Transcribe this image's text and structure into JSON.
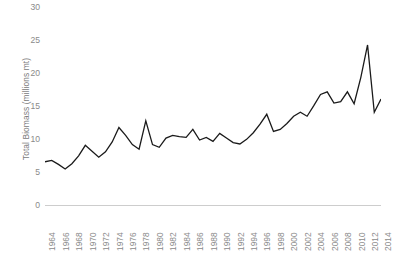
{
  "chart_data": {
    "type": "line",
    "title": "",
    "xlabel": "",
    "ylabel": "Total Biomass (millions mt)",
    "ylim": [
      0,
      30
    ],
    "xlim": [
      1964,
      2014
    ],
    "grid": false,
    "legend": false,
    "y_ticks": [
      0,
      5,
      10,
      15,
      20,
      25,
      30
    ],
    "x_ticks": [
      1964,
      1966,
      1968,
      1970,
      1972,
      1974,
      1976,
      1978,
      1980,
      1982,
      1984,
      1986,
      1988,
      1990,
      1992,
      1994,
      1996,
      1998,
      2000,
      2002,
      2004,
      2006,
      2008,
      2010,
      2012,
      2014
    ],
    "series": [
      {
        "name": "Total Biomass",
        "color": "#1a1a1a",
        "x": [
          1964,
          1965,
          1966,
          1967,
          1968,
          1969,
          1970,
          1971,
          1972,
          1973,
          1974,
          1975,
          1976,
          1977,
          1978,
          1979,
          1980,
          1981,
          1982,
          1983,
          1984,
          1985,
          1986,
          1987,
          1988,
          1989,
          1990,
          1991,
          1992,
          1993,
          1994,
          1995,
          1996,
          1997,
          1998,
          1999,
          2000,
          2001,
          2002,
          2003,
          2004,
          2005,
          2006,
          2007,
          2008,
          2009,
          2010,
          2011,
          2012,
          2013,
          2014
        ],
        "values": [
          6.7,
          6.9,
          6.3,
          5.6,
          6.4,
          7.6,
          9.2,
          8.3,
          7.4,
          8.2,
          9.7,
          11.9,
          10.7,
          9.3,
          8.6,
          12.9,
          9.3,
          8.9,
          10.3,
          10.7,
          10.5,
          10.4,
          11.6,
          10.0,
          10.4,
          9.8,
          11.0,
          10.3,
          9.6,
          9.4,
          10.1,
          11.1,
          12.4,
          13.9,
          11.3,
          11.6,
          12.5,
          13.6,
          14.2,
          13.6,
          15.2,
          16.9,
          17.3,
          15.6,
          15.8,
          17.3,
          15.5,
          19.5,
          24.4,
          14.2,
          16.2
        ]
      }
    ]
  },
  "axis": {
    "y_title": "Total Biomass (millions mt)",
    "y_labels": [
      "30",
      "25",
      "20",
      "15",
      "10",
      "5",
      "0"
    ],
    "x_labels": [
      "1964",
      "1966",
      "1968",
      "1970",
      "1972",
      "1974",
      "1976",
      "1978",
      "1980",
      "1982",
      "1984",
      "1986",
      "1988",
      "1990",
      "1992",
      "1994",
      "1996",
      "1998",
      "2000",
      "2002",
      "2004",
      "2006",
      "2008",
      "2010",
      "2012",
      "2014"
    ]
  },
  "colors": {
    "line": "#1a1a1a",
    "axis": "#9a9a9a",
    "text": "#8a8a8a",
    "background": "#ffffff"
  }
}
